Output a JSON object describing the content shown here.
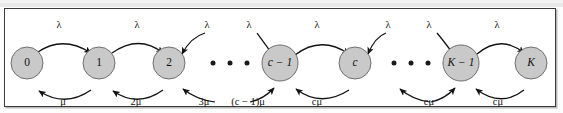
{
  "figure": {
    "kind": "markov-chain-state-transition-diagram",
    "colors": {
      "state_fill": "#c9c9c9",
      "state_stroke": "#6f6f6f",
      "arrow": "#111111",
      "frame": "#3a3a3a",
      "background": "#ffffff"
    }
  },
  "states": [
    {
      "id": "s0",
      "label": "0",
      "cx": 26,
      "cy": 62,
      "r": 16,
      "italic": false
    },
    {
      "id": "s1",
      "label": "1",
      "cx": 98,
      "cy": 62,
      "r": 16,
      "italic": false
    },
    {
      "id": "s2",
      "label": "2",
      "cx": 168,
      "cy": 62,
      "r": 16,
      "italic": false
    },
    {
      "id": "sc1",
      "label": "c − 1",
      "cx": 279,
      "cy": 62,
      "r": 18,
      "italic": true
    },
    {
      "id": "sc",
      "label": "c",
      "cx": 354,
      "cy": 62,
      "r": 16,
      "italic": true
    },
    {
      "id": "sK1",
      "label": "K − 1",
      "cx": 460,
      "cy": 62,
      "r": 18,
      "italic": true
    },
    {
      "id": "sK",
      "label": "K",
      "cx": 530,
      "cy": 62,
      "r": 16,
      "italic": true
    }
  ],
  "ellipsis_groups": [
    {
      "id": "gap-1",
      "dots": [
        {
          "cx": 212,
          "cy": 62
        },
        {
          "cx": 229,
          "cy": 62
        },
        {
          "cx": 246,
          "cy": 62
        }
      ]
    },
    {
      "id": "gap-2",
      "dots": [
        {
          "cx": 393,
          "cy": 62
        },
        {
          "cx": 410,
          "cy": 62
        },
        {
          "cx": 427,
          "cy": 62
        }
      ]
    }
  ],
  "arrival_rates": [
    {
      "id": "lam-0-1",
      "text": "λ",
      "x": 58,
      "y": 24
    },
    {
      "id": "lam-1-2",
      "text": "λ",
      "x": 136,
      "y": 24
    },
    {
      "id": "lam-2-dots",
      "text": "λ",
      "x": 206,
      "y": 24
    },
    {
      "id": "lam-dots-c1",
      "text": "λ",
      "x": 248,
      "y": 24
    },
    {
      "id": "lam-c1-c",
      "text": "λ",
      "x": 316,
      "y": 24
    },
    {
      "id": "lam-c-dots",
      "text": "λ",
      "x": 387,
      "y": 24
    },
    {
      "id": "lam-dots-K1",
      "text": "λ",
      "x": 428,
      "y": 24
    },
    {
      "id": "lam-K1-K",
      "text": "λ",
      "x": 496,
      "y": 24
    }
  ],
  "service_rates": [
    {
      "id": "mu-1-0",
      "text": "μ",
      "x": 62,
      "y": 101
    },
    {
      "id": "mu-2-1",
      "text": "2μ",
      "x": 135,
      "y": 101
    },
    {
      "id": "mu-3-2",
      "text": "3μ",
      "x": 203,
      "y": 101
    },
    {
      "id": "mu-c1",
      "text": "(c − 1)μ",
      "x": 247,
      "y": 101
    },
    {
      "id": "mu-c-c1",
      "text": "cμ",
      "x": 316,
      "y": 101
    },
    {
      "id": "mu-c-dots",
      "text": "cμ",
      "x": 428,
      "y": 101
    },
    {
      "id": "mu-K-K1",
      "text": "cμ",
      "x": 497,
      "y": 101
    }
  ],
  "transitions": {
    "forward_note": "upper arcs carry arrival rate lambda from left state to right state",
    "backward_note": "lower arcs carry service rate from right state to left state"
  }
}
